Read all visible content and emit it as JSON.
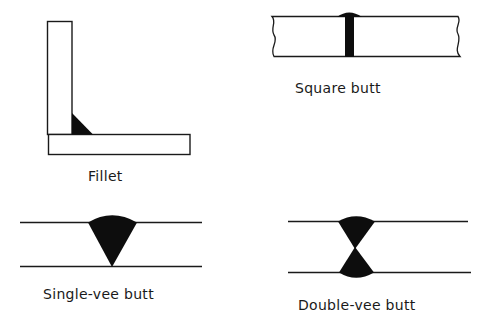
{
  "diagram": {
    "colors": {
      "line": "#1a1a1a",
      "weld": "#0d0d0d",
      "background": "#ffffff"
    },
    "joints": [
      {
        "id": "fillet",
        "label": "Fillet"
      },
      {
        "id": "square-butt",
        "label": "Square butt"
      },
      {
        "id": "single-vee-butt",
        "label": "Single-vee butt"
      },
      {
        "id": "double-vee-butt",
        "label": "Double-vee butt"
      }
    ]
  }
}
